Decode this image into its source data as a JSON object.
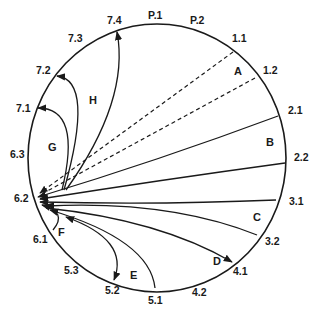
{
  "diagram": {
    "type": "circular-connection-diagram",
    "hub_label": "6.2",
    "point_labels": [
      {
        "id": "P.1",
        "text": "P.1",
        "x": 148,
        "y": 19
      },
      {
        "id": "P.2",
        "text": "P.2",
        "x": 190,
        "y": 24
      },
      {
        "id": "1.1",
        "text": "1.1",
        "x": 232,
        "y": 42
      },
      {
        "id": "1.2",
        "text": "1.2",
        "x": 263,
        "y": 74
      },
      {
        "id": "2.1",
        "text": "2.1",
        "x": 288,
        "y": 114
      },
      {
        "id": "2.2",
        "text": "2.2",
        "x": 294,
        "y": 161
      },
      {
        "id": "3.1",
        "text": "3.1",
        "x": 289,
        "y": 205
      },
      {
        "id": "3.2",
        "text": "3.2",
        "x": 265,
        "y": 245
      },
      {
        "id": "4.1",
        "text": "4.1",
        "x": 233,
        "y": 275
      },
      {
        "id": "4.2",
        "text": "4.2",
        "x": 192,
        "y": 296
      },
      {
        "id": "5.1",
        "text": "5.1",
        "x": 148,
        "y": 304
      },
      {
        "id": "5.2",
        "text": "5.2",
        "x": 105,
        "y": 294
      },
      {
        "id": "5.3",
        "text": "5.3",
        "x": 64,
        "y": 274
      },
      {
        "id": "6.1",
        "text": "6.1",
        "x": 33,
        "y": 243
      },
      {
        "id": "6.2",
        "text": "6.2",
        "x": 14,
        "y": 202
      },
      {
        "id": "6.3",
        "text": "6.3",
        "x": 10,
        "y": 158
      },
      {
        "id": "7.1",
        "text": "7.1",
        "x": 16,
        "y": 112
      },
      {
        "id": "7.2",
        "text": "7.2",
        "x": 36,
        "y": 74
      },
      {
        "id": "7.3",
        "text": "7.3",
        "x": 68,
        "y": 42
      },
      {
        "id": "7.4",
        "text": "7.4",
        "x": 107,
        "y": 24
      }
    ],
    "regions": [
      {
        "id": "A",
        "text": "A",
        "x": 234,
        "y": 75
      },
      {
        "id": "B",
        "text": "B",
        "x": 266,
        "y": 146
      },
      {
        "id": "C",
        "text": "C",
        "x": 253,
        "y": 221
      },
      {
        "id": "D",
        "text": "D",
        "x": 213,
        "y": 265
      },
      {
        "id": "E",
        "text": "E",
        "x": 130,
        "y": 279
      },
      {
        "id": "F",
        "text": "F",
        "x": 58,
        "y": 236
      },
      {
        "id": "G",
        "text": "G",
        "x": 48,
        "y": 151
      },
      {
        "id": "H",
        "text": "H",
        "x": 89,
        "y": 104
      }
    ],
    "connections": [
      {
        "from": "1.1",
        "to": "6.2",
        "style": "dashed",
        "region": "A"
      },
      {
        "from": "1.2",
        "to": "6.2",
        "style": "dashed",
        "region": "A"
      },
      {
        "from": "2.1",
        "to": "6.2",
        "style": "solid",
        "region": "B"
      },
      {
        "from": "2.2",
        "to": "6.2",
        "style": "solid",
        "region": "B"
      },
      {
        "from": "3.1",
        "to": "6.2",
        "style": "solid",
        "region": "C"
      },
      {
        "from": "3.2",
        "to": "6.2",
        "style": "solid",
        "region": "C"
      },
      {
        "from": "6.2",
        "to": "4.1",
        "style": "solid",
        "region": "D"
      },
      {
        "from": "5.1",
        "to": "6.2",
        "style": "solid",
        "region": "E"
      },
      {
        "from": "6.2",
        "to": "5.2",
        "style": "solid",
        "region": "E"
      },
      {
        "from": "6.1",
        "to": "6.2",
        "style": "solid",
        "region": "F"
      },
      {
        "from": "6.2",
        "to": "7.1",
        "style": "solid",
        "region": "G"
      },
      {
        "from": "6.2",
        "to": "7.2",
        "style": "solid",
        "region": "H"
      },
      {
        "from": "6.2",
        "to": "7.4",
        "style": "solid",
        "region": "H"
      }
    ]
  }
}
